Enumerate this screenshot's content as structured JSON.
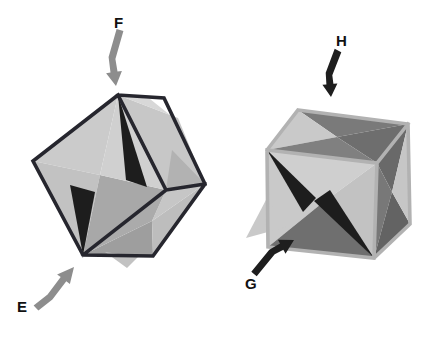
{
  "canvas": {
    "width": 435,
    "height": 339,
    "background": "#ffffff"
  },
  "colors": {
    "left_frame": "#26262e",
    "right_frame": "#b2b2b2",
    "light_face": "#c9c9c9",
    "mid_face": "#a8a8a8",
    "dark_face": "#6f6f6f",
    "spike_black": "#1d1d1d",
    "gray_arrow": "#8d8d8d",
    "black_arrow": "#1e1e1e",
    "label_text": "#111111"
  },
  "figures": [
    {
      "id": "left-figure-cube-on-corner",
      "description": "dark wireframe cube balanced on a corner containing a star octahedron, compressed along body diagonal",
      "labels": [
        {
          "id": "label-f",
          "text": "F"
        },
        {
          "id": "label-e",
          "text": "E"
        }
      ],
      "polygons": [
        {
          "name": "star-face",
          "points": "118,95 33,161 100,175",
          "fill": "#cbcbcb"
        },
        {
          "name": "star-face",
          "points": "33,161 83,255 100,175",
          "fill": "#c2c2c2"
        },
        {
          "name": "star-face",
          "points": "83,255 166,190 100,175",
          "fill": "#a8a8a8"
        },
        {
          "name": "star-face",
          "points": "166,190 118,95 100,175",
          "fill": "#d0d0d0"
        },
        {
          "name": "star-face",
          "points": "118,95 178,118 205,184 166,190",
          "fill": "#c7c7c7"
        },
        {
          "name": "star-face",
          "points": "118,95 150,99 170,115",
          "fill": "#d8d8d8"
        },
        {
          "name": "star-face",
          "points": "166,190 205,184 172,150",
          "fill": "#b2b2b2"
        },
        {
          "name": "star-face",
          "points": "83,255 153,256 152,221",
          "fill": "#9e9e9e"
        },
        {
          "name": "star-face",
          "points": "153,256 205,184 152,221",
          "fill": "#bdbdbd"
        },
        {
          "name": "star-face",
          "points": "205,184 166,190 152,221",
          "fill": "#c6c6c6"
        },
        {
          "name": "star-face",
          "points": "166,190 83,255 152,221",
          "fill": "#ababab"
        },
        {
          "name": "star-spike-poke",
          "points": "105,252 138,257 127,268",
          "fill": "#c2c2c2"
        },
        {
          "name": "star-spike-dark",
          "points": "118,95 126,180 147,187",
          "fill": "#1d1d1d"
        },
        {
          "name": "star-spike-dark",
          "points": "83,255 70,185 95,192",
          "fill": "#1d1d1d"
        }
      ],
      "frame": {
        "name": "cube-frame-dark",
        "path": "M118,95 L33,161 L83,255 L153,256 L205,184 L164,98 Z M118,95 L166,190 M166,190 L205,184 M166,190 L83,255",
        "stroke": "#26262e",
        "width": 3.6
      },
      "arrows": [
        {
          "id": "arrow-f",
          "direction": "down",
          "points": "116.6,29 108.6,57 110.5,72.6 106.1,73.2 116,86 121.9,71 117.5,71.6 115.4,59 123.4,31",
          "fill": "#8d8d8d"
        },
        {
          "id": "arrow-e",
          "direction": "up-right",
          "points": "38.4,310.6 52.4,299.6 66.3,281.3 69.9,284 74,267 57.1,274.4 60.7,277.1 47.6,294.4 33.6,305.4",
          "fill": "#8d8d8d"
        }
      ]
    },
    {
      "id": "right-figure-cube-face-on",
      "description": "light gray wireframe cube containing a star octahedron with dark faces, compressed along face normal",
      "labels": [
        {
          "id": "label-h",
          "text": "H"
        },
        {
          "id": "label-g",
          "text": "G"
        }
      ],
      "polygons": [
        {
          "name": "star-face",
          "points": "298,110 408,124 337,137",
          "fill": "#7a7a7a"
        },
        {
          "name": "star-face",
          "points": "298,110 267,150 337,137",
          "fill": "#c9c9c9"
        },
        {
          "name": "star-face",
          "points": "408,124 377,163 337,137",
          "fill": "#6e6e6e"
        },
        {
          "name": "star-face",
          "points": "267,150 377,163 337,137",
          "fill": "#808080"
        },
        {
          "name": "star-face",
          "points": "267,150 377,163 321,204",
          "fill": "#cfcfcf"
        },
        {
          "name": "star-face",
          "points": "267,150 268,247 321,204",
          "fill": "#c9c9c9"
        },
        {
          "name": "star-face",
          "points": "268,247 374,258 321,204",
          "fill": "#6f6f6f"
        },
        {
          "name": "star-face",
          "points": "377,163 374,258 321,204",
          "fill": "#c2c2c2"
        },
        {
          "name": "star-face",
          "points": "408,124 377,163 392,192",
          "fill": "#696969"
        },
        {
          "name": "star-face",
          "points": "377,163 374,258 392,192",
          "fill": "#787878"
        },
        {
          "name": "star-face",
          "points": "374,258 410,224 392,192",
          "fill": "#636363"
        },
        {
          "name": "star-face",
          "points": "408,124 410,224 392,192",
          "fill": "#c6c6c6"
        },
        {
          "name": "star-spike-poke",
          "points": "267,198 246,238 286,227",
          "fill": "#c9c9c9"
        },
        {
          "name": "star-spike-dark",
          "points": "267,150 316,198 303,212",
          "fill": "#1d1d1d"
        },
        {
          "name": "star-spike-dark",
          "points": "374,258 314,201 330,190",
          "fill": "#1d1d1d"
        }
      ],
      "frame": {
        "name": "cube-frame-gray",
        "path": "M298,110 L408,124 L410,224 L374,258 L268,247 L267,150 Z M267,150 L377,163 L408,124 M377,163 L374,258",
        "stroke": "#b2b2b2",
        "width": 3.6
      },
      "arrows": [
        {
          "id": "arrow-h",
          "direction": "down",
          "points": "334.7,48.8 325.7,72.8 326.4,84.4 322.4,84.8 331,97 337.4,83.4 333.4,83.8 332.3,75.2 341.3,52.2",
          "fill": "#1e1e1e"
        },
        {
          "id": "arrow-g",
          "direction": "up-right",
          "points": "256.7,276.2 274.7,254.2 283.4,249.8 285.5,253.7 294,240 277.9,239.7 280,243.6 269.3,249.8 251.3,271.8",
          "fill": "#1e1e1e"
        }
      ]
    }
  ]
}
